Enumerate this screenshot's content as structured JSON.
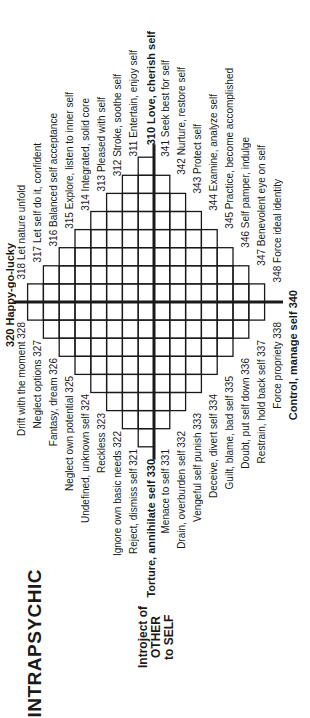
{
  "diagram": {
    "title": "INTRAPSYCHIC",
    "subtitle_lines": [
      "Introject of",
      "OTHER",
      "to SELF"
    ],
    "grid": {
      "center_x": 154,
      "center_y": 302,
      "cell_width": 15.8,
      "cell_height": 18.1,
      "rows_above_axis": [
        [
          1,
          0
        ],
        [
          2,
          1
        ],
        [
          3,
          2
        ],
        [
          4,
          3
        ],
        [
          5,
          4
        ],
        [
          6,
          5
        ],
        [
          7,
          6
        ],
        [
          8,
          7
        ]
      ],
      "rows_below_axis": [
        [
          8,
          7
        ],
        [
          7,
          6
        ],
        [
          6,
          5
        ],
        [
          5,
          4
        ],
        [
          4,
          3
        ],
        [
          3,
          2
        ],
        [
          2,
          1
        ],
        [
          1,
          0
        ]
      ],
      "line_color": "#1a1a1a"
    },
    "poles": {
      "top": "310 Love, cherish self",
      "bottom": "Torture, annihilate self 330",
      "left": "320 Happy-go-lucky",
      "right": "Control, manage self 340"
    },
    "quadrant_top_left": [
      "311 Entertain, enjoy self",
      "312 Stroke, soothe self",
      "313 Pleased with self",
      "314 Integrated, solid core",
      "315 Explore, listen to inner self",
      "316 Balanced self acceptance",
      "317 Let self do it, confident",
      "318 Let nature unfold"
    ],
    "quadrant_top_right": [
      "341 Seek best for self",
      "342 Nurture, restore self",
      "343 Protect self",
      "344 Examine, analyze self",
      "345 Practice, become accomplished",
      "346 Self pamper, indulge",
      "347 Benevolent eye on self",
      "348 Force ideal identity"
    ],
    "quadrant_bottom_left": [
      "Reject, dismiss self 321",
      "Ignore own basic needs 322",
      "Reckless 323",
      "Undefined, unknown self 324",
      "Neglect own potential 325",
      "Fantasy, dream 326",
      "Neglect options 327",
      "Drift with the moment 328"
    ],
    "quadrant_bottom_right": [
      "Menace to self 331",
      "Drain, overburden self 332",
      "Vengeful self punish 333",
      "Deceive, divert self 334",
      "Guilt, blame, bad self 335",
      "Doubt, put self down 336",
      "Restrain, hold back self 337",
      "Force propriety 338"
    ]
  }
}
